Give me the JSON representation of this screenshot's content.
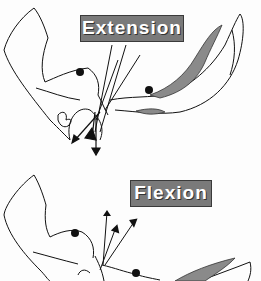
{
  "labels": {
    "extension": "Extension",
    "flexion": "Flexion"
  },
  "colors": {
    "label_bg": "#7a7a7a",
    "label_text": "#ffffff",
    "stroke": "#111111",
    "shaded_region": "#8a8a8a"
  },
  "panels": [
    {
      "name": "extension",
      "label": "Extension",
      "description": "Pelvis/sacrum outline with vector arrows pointing downward"
    },
    {
      "name": "flexion",
      "label": "Flexion",
      "description": "Pelvis/sacrum outline with vector arrows pointing upward"
    }
  ]
}
